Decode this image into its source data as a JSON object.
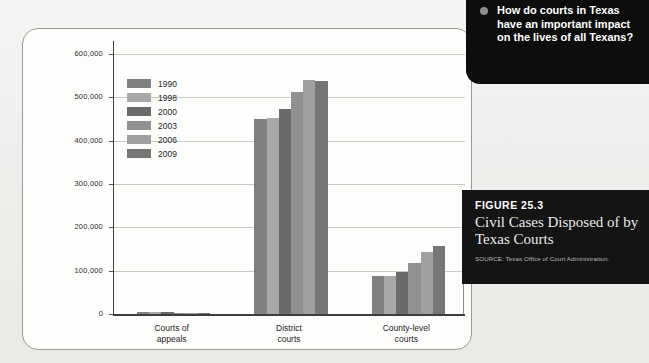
{
  "figure": {
    "number": "FIGURE 25.3",
    "title": "Civil Cases Disposed of by Texas Courts",
    "source": "SOURCE: Texas Office of Court Administration."
  },
  "question": {
    "bullet": "bullet-dot",
    "text": "How do courts in Texas have an important impact on the lives of all Texans?"
  },
  "chart_data": {
    "type": "bar",
    "title": "Civil Cases Disposed of by Texas Courts",
    "xlabel": "",
    "ylabel": "",
    "ylim": [
      0,
      600000
    ],
    "yticks": [
      0,
      100000,
      200000,
      300000,
      400000,
      500000,
      600000
    ],
    "ytick_labels": [
      "0",
      "100,000",
      "200,000",
      "300,000",
      "400,000",
      "500,000",
      "600,000"
    ],
    "grid": true,
    "legend_position": "upper-left-inside",
    "categories": [
      "Courts of appeals",
      "District courts",
      "County-level courts"
    ],
    "category_labels": [
      [
        "Courts of",
        "appeals"
      ],
      [
        "District",
        "courts"
      ],
      [
        "County-level",
        "courts"
      ]
    ],
    "series": [
      {
        "name": "1990",
        "color": "#808080",
        "values": [
          5000,
          450000,
          87000
        ]
      },
      {
        "name": "1998",
        "color": "#a8a8a8",
        "values": [
          4500,
          452000,
          88000
        ]
      },
      {
        "name": "2000",
        "color": "#6b6b6b",
        "values": [
          3500,
          473000,
          97000
        ]
      },
      {
        "name": "2003",
        "color": "#919191",
        "values": [
          3000,
          512000,
          117000
        ]
      },
      {
        "name": "2006",
        "color": "#a0a0a0",
        "values": [
          2800,
          540000,
          142000
        ]
      },
      {
        "name": "2009",
        "color": "#767676",
        "values": [
          3000,
          538000,
          158000
        ]
      }
    ]
  },
  "colors": {
    "panel_background": "#fdfdfc",
    "panel_border": "#9a9a96",
    "gridline": "#c9c9c6",
    "axis": "#3d3d3d",
    "caption_background": "#141414",
    "question_background": "#0d0d0d"
  }
}
